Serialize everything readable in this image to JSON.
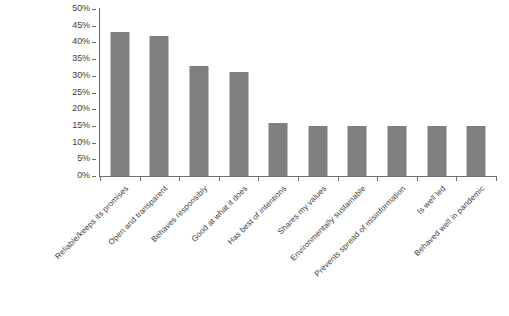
{
  "chart_data": {
    "type": "bar",
    "title": "",
    "subtitle": "",
    "xlabel": "",
    "ylabel": "",
    "ylim": [
      0,
      50
    ],
    "ytick_step": 5,
    "ytick_labels": [
      "0%",
      "5%",
      "10%",
      "15%",
      "20%",
      "25%",
      "30%",
      "35%",
      "40%",
      "45%",
      "50%"
    ],
    "ytick_values": [
      0,
      5,
      10,
      15,
      20,
      25,
      30,
      35,
      40,
      45,
      50
    ],
    "grid": false,
    "legend": false,
    "legend_position": "none",
    "bar_color": "#808080",
    "axis_color": "#6f6f6f",
    "categories": [
      "Reliable/keeps its promises",
      "Open and transparent",
      "Behaves responsibly",
      "Good at what it does",
      "Has best of intentions",
      "Shares my values",
      "Environmentally sustainable",
      "Prevents spread of misinformation",
      "Is well led",
      "Behaved well in pandemic"
    ],
    "values": [
      43,
      42,
      33,
      31,
      16,
      15,
      15,
      15,
      15,
      15
    ],
    "value_labels": [
      "43%",
      "42%",
      "33%",
      "31%",
      "16%",
      "15%",
      "15%",
      "15%",
      "15%",
      "15%"
    ]
  }
}
